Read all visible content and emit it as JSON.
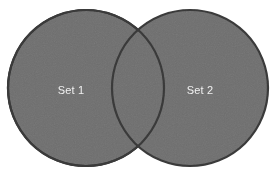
{
  "diagram": {
    "type": "venn",
    "title": "",
    "background_color": "#ffffff",
    "sets": [
      {
        "id": "set-1",
        "label": "Set 1",
        "fill_color": "#6e6e6e",
        "stroke_color": "#383838",
        "label_color": "#f0f0f0",
        "cx": 86,
        "cy": 88,
        "r": 78,
        "label_x": 71,
        "label_y": 91
      },
      {
        "id": "set-2",
        "label": "Set 2",
        "fill_color": "#6e6e6e",
        "stroke_color": "#383838",
        "label_color": "#f0f0f0",
        "cx": 190,
        "cy": 88,
        "r": 78,
        "label_x": 200,
        "label_y": 91
      }
    ],
    "intersection": {
      "label": "",
      "fill_color": "#6e6e6e",
      "stroke_color": "#383838"
    }
  }
}
